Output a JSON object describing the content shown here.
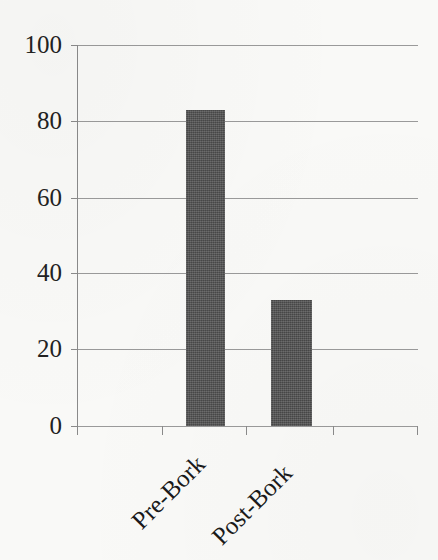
{
  "chart_data": {
    "type": "bar",
    "title": "",
    "subtitle": "",
    "xlabel": "",
    "ylabel": "",
    "categories": [
      "Pre-Bork",
      "Post-Bork"
    ],
    "values": [
      83,
      33
    ],
    "series": [
      {
        "name": "",
        "values": [
          83,
          33
        ]
      }
    ],
    "ylim": [
      0,
      100
    ],
    "y_ticks": [
      "0",
      "20",
      "40",
      "60",
      "80",
      "100"
    ],
    "y_tick_values": [
      0,
      20,
      40,
      60,
      80,
      100
    ],
    "grid": "horizontal",
    "legend": "none",
    "bar_color": "#4f4f4f",
    "gridline_color": "#9a9a9a",
    "axis_color": "#8a8a8a",
    "background_color": "#f9f9f7",
    "text_color": "#1a1a1a",
    "x_tick_count": 5,
    "annotations": []
  }
}
